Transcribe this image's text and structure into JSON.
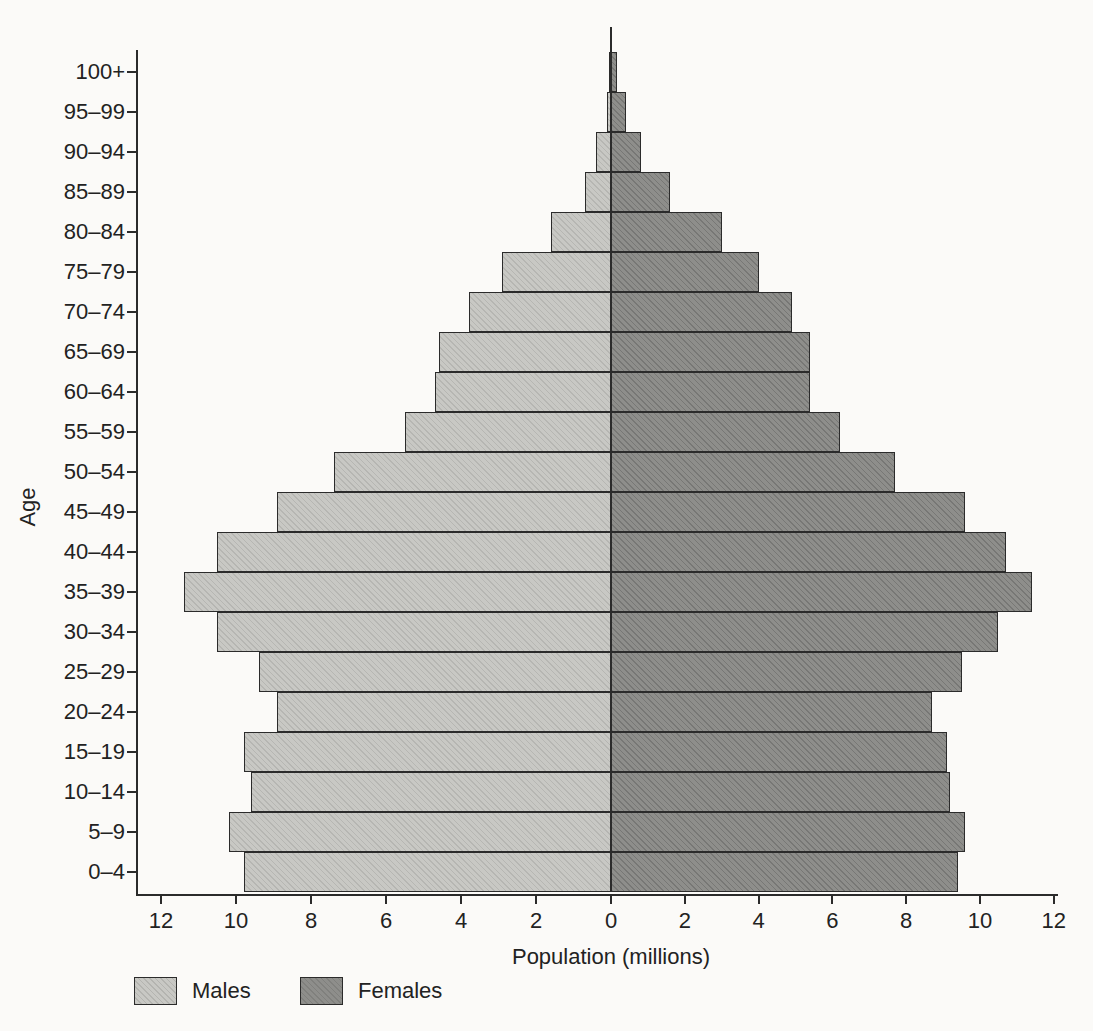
{
  "figure": {
    "background_color": "#fbfaf8",
    "text_color": "#222222",
    "outline_color": "#2b2b2b"
  },
  "chart_data": {
    "type": "bar",
    "subtype": "population_pyramid",
    "orientation": "horizontal",
    "title": "",
    "xlabel": "Population (millions)",
    "ylabel": "Age",
    "x_tick_values": [
      0,
      2,
      4,
      6,
      8,
      10,
      12
    ],
    "xlim_each_side": [
      0,
      12
    ],
    "grid": false,
    "legend_position": "bottom-left",
    "categories_order": "youngest-first",
    "categories": [
      "0–4",
      "5–9",
      "10–14",
      "15–19",
      "20–24",
      "25–29",
      "30–34",
      "35–39",
      "40–44",
      "45–49",
      "50–54",
      "55–59",
      "60–64",
      "65–69",
      "70–74",
      "75–79",
      "80–84",
      "85–89",
      "90–94",
      "95–99",
      "100+"
    ],
    "series": [
      {
        "name": "Males",
        "side": "left",
        "color": "#c8c8c4",
        "values": [
          9.8,
          10.2,
          9.6,
          9.8,
          8.9,
          9.4,
          10.5,
          11.4,
          10.5,
          8.9,
          7.4,
          5.5,
          4.7,
          4.6,
          3.8,
          2.9,
          1.6,
          0.7,
          0.4,
          0.1,
          0.05
        ]
      },
      {
        "name": "Females",
        "side": "right",
        "color": "#8e8e8b",
        "values": [
          9.4,
          9.6,
          9.2,
          9.1,
          8.7,
          9.5,
          10.5,
          11.4,
          10.7,
          9.6,
          7.7,
          6.2,
          5.4,
          5.4,
          4.9,
          4.0,
          3.0,
          1.6,
          0.8,
          0.4,
          0.15
        ]
      }
    ]
  }
}
